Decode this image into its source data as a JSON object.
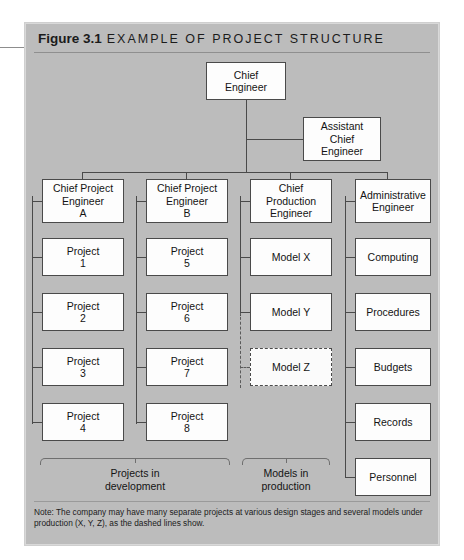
{
  "figure": {
    "number": "Figure 3.1",
    "caption": "EXAMPLE OF PROJECT STRUCTURE"
  },
  "nodes": {
    "chief_engineer": "Chief\nEngineer",
    "assistant_chief_engineer": "Assistant\nChief\nEngineer",
    "col1_head": "Chief Project\nEngineer\nA",
    "col2_head": "Chief Project\nEngineer\nB",
    "col3_head": "Chief\nProduction\nEngineer",
    "col4_head": "Administrative\nEngineer",
    "col1_items": [
      "Project\n1",
      "Project\n2",
      "Project\n3",
      "Project\n4"
    ],
    "col2_items": [
      "Project\n5",
      "Project\n6",
      "Project\n7",
      "Project\n8"
    ],
    "col3_items": [
      "Model X",
      "Model Y",
      "Model Z"
    ],
    "col4_items": [
      "Computing",
      "Procedures",
      "Budgets",
      "Records",
      "Personnel"
    ]
  },
  "braces": {
    "projects": "Projects in\ndevelopment",
    "models": "Models in\nproduction"
  },
  "note": {
    "text": "Note: The company may have many separate projects at various design stages and several models under production (X, Y, Z), as the dashed lines show."
  },
  "colors": {
    "panel_background": "#bcbcbc",
    "box_fill": "#fdfdfd",
    "line": "#4a4a4a",
    "text": "#141414",
    "page_background": "#ffffff"
  }
}
